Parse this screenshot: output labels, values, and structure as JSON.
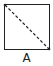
{
  "diagram": {
    "shape": "square",
    "diagonal": {
      "from": "top-left",
      "to": "bottom-right",
      "style": "dashed"
    },
    "label": "A",
    "colors": {
      "stroke": "#222222",
      "background": "#ffffff"
    }
  }
}
